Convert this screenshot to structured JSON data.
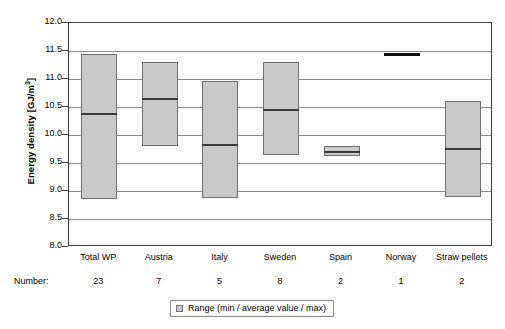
{
  "chart_data": {
    "type": "bar",
    "chart_kind": "floating-range-bar",
    "title": "",
    "xlabel": "",
    "ylabel": "Energy density [GJ/m³]",
    "ylabel_text": "Energy density [GJ/m",
    "ylabel_exponent": "3",
    "ylabel_tail": "]",
    "ylim": [
      8.0,
      12.0
    ],
    "ytick_step": 0.5,
    "ytick_labels": [
      "12.0",
      "11.5",
      "11.0",
      "10.5",
      "10.0",
      "9.5",
      "9.0",
      "8.5",
      "8.0"
    ],
    "ytick_values": [
      12.0,
      11.5,
      11.0,
      10.5,
      10.0,
      9.5,
      9.0,
      8.5,
      8.0
    ],
    "grid": true,
    "legend_position": "bottom-center",
    "legend": [
      "Range (min / average value / max)"
    ],
    "categories": [
      "Total WP",
      "Austria",
      "Italy",
      "Sweden",
      "Spain",
      "Norway",
      "Straw pellets"
    ],
    "number_caption": "Number:",
    "numbers": [
      "23",
      "7",
      "5",
      "8",
      "2",
      "1",
      "2"
    ],
    "series": [
      {
        "name": "min",
        "values": [
          8.85,
          9.8,
          8.87,
          9.65,
          9.62,
          11.45,
          8.9
        ]
      },
      {
        "name": "average value",
        "values": [
          10.37,
          10.65,
          9.82,
          10.45,
          9.7,
          11.45,
          9.75
        ]
      },
      {
        "name": "max",
        "values": [
          11.45,
          11.3,
          10.97,
          11.3,
          9.8,
          11.45,
          10.6
        ]
      }
    ],
    "colors": {
      "bar_fill": "#c9c9c9",
      "bar_border": "#6e6e6e",
      "mean_line": "#3a3a3a",
      "gridline": "#8a8a8a",
      "frame": "#3a3a3a",
      "single_value_line": "#111111",
      "background": "#ffffff"
    }
  },
  "legend": {
    "label": "Range (min / average value / max)"
  }
}
